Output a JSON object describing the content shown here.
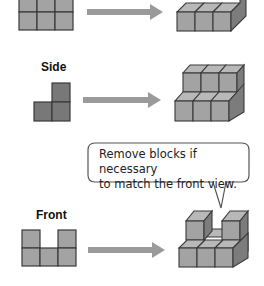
{
  "sections": [
    {
      "id": "top",
      "label": "",
      "view_shape": "2x3 grid (top view)",
      "result": "1-layer 3x2 block stack"
    },
    {
      "id": "side",
      "label": "Side",
      "view_shape": "L-shape (side view)",
      "result": "2-step staircase block stack"
    },
    {
      "id": "front",
      "label": "Front",
      "view_shape": "U-shape (front view)",
      "result": "block stack with middle top removed"
    }
  ],
  "callout": {
    "line1": "Remove blocks if necessary",
    "line2": "to match the front view."
  },
  "colors": {
    "block_light": "#a3a3a3",
    "block_top": "#b8b8b8",
    "block_side": "#7c7c7c",
    "block_dark": "#787878",
    "outline": "#3a3a3a",
    "arrow": "#9a9a9a",
    "callout_border": "#555555"
  }
}
